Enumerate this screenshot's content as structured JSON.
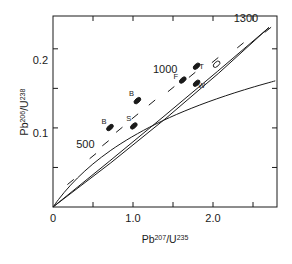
{
  "chart_data": {
    "type": "scatter",
    "title": "",
    "subtitle": "",
    "xlabel": "Pb207/U235",
    "ylabel": "Pb206/U238",
    "xlabel_parts": {
      "base1": "Pb",
      "sup1": "207",
      "slash": "/",
      "base2": "U",
      "sup2": "235"
    },
    "ylabel_parts": {
      "base1": "Pb",
      "sup1": "206",
      "slash": "/",
      "base2": "U",
      "sup2": "238"
    },
    "xlim": [
      0.0,
      2.8
    ],
    "ylim": [
      0.0,
      0.2415
    ],
    "grid": false,
    "legend": "none",
    "xticks": [
      0.0,
      0.5,
      1.0,
      1.5,
      2.0,
      2.5
    ],
    "xticklabels": [
      "0",
      "",
      "1.0",
      "",
      "2.0",
      ""
    ],
    "yticks": [
      0.0,
      0.05,
      0.1,
      0.15,
      0.2
    ],
    "yticklabels": [
      "",
      "",
      "0.1",
      "",
      "0.2"
    ],
    "curves": [
      {
        "name": "concordia",
        "style": "solid-with-age-ticks",
        "points": [
          [
            0.0,
            0.0
          ],
          [
            0.0676,
            0.00932
          ],
          [
            0.1408,
            0.01853
          ],
          [
            0.22,
            0.02765
          ],
          [
            0.3057,
            0.03665
          ],
          [
            0.3982,
            0.04556
          ],
          [
            0.4982,
            0.05436
          ],
          [
            0.6062,
            0.06306
          ],
          [
            0.7228,
            0.07166
          ],
          [
            0.8486,
            0.08015
          ],
          [
            0.9841,
            0.08854
          ],
          [
            1.1302,
            0.09683
          ],
          [
            1.2875,
            0.10501
          ],
          [
            1.4569,
            0.11309
          ],
          [
            1.6391,
            0.12108
          ],
          [
            1.8352,
            0.12896
          ],
          [
            2.0461,
            0.13674
          ],
          [
            2.2728,
            0.14442
          ],
          [
            2.5165,
            0.15201
          ],
          [
            2.7783,
            0.1595
          ]
        ],
        "age_ticks": [
          {
            "age": 200,
            "x": 0.22,
            "y": 0.03165
          },
          {
            "age": 400,
            "x": 0.4982,
            "y": 0.06436
          },
          {
            "age": 500,
            "x": 0.6562,
            "y": 0.08056
          },
          {
            "age": 600,
            "x": 0.8286,
            "y": 0.09766
          },
          {
            "age": 700,
            "x": 1.0241,
            "y": 0.11454
          },
          {
            "age": 800,
            "x": 1.2375,
            "y": 0.13201
          },
          {
            "age": 900,
            "x": 1.4769,
            "y": 0.14909
          },
          {
            "age": 1000,
            "x": 1.7391,
            "y": 0.16708
          },
          {
            "age": 1100,
            "x": 2.0261,
            "y": 0.18574
          },
          {
            "age": 1200,
            "x": 2.3428,
            "y": 0.20442
          },
          {
            "age": 1300,
            "x": 2.6865,
            "y": 0.22401
          }
        ]
      },
      {
        "name": "discordia-upper",
        "style": "solid",
        "points": [
          [
            0.0,
            0.0
          ],
          [
            2.7,
            0.227
          ]
        ]
      },
      {
        "name": "discordia-lower",
        "style": "solid",
        "points": [
          [
            0.0,
            0.0
          ],
          [
            2.7,
            0.227
          ]
        ]
      }
    ],
    "age_labels": [
      {
        "text": "500",
        "x": 0.52,
        "y": 0.0745,
        "anchor": "end"
      },
      {
        "text": "1000",
        "x": 1.555,
        "y": 0.17,
        "anchor": "end"
      },
      {
        "text": "1300",
        "x": 2.565,
        "y": 0.2335,
        "anchor": "end"
      }
    ],
    "points": [
      {
        "label": "B",
        "x": 0.712,
        "y": 0.1005,
        "fill": "solid",
        "label_dx": -6,
        "label_dy": -4
      },
      {
        "label": "B",
        "x": 1.055,
        "y": 0.1345,
        "fill": "solid",
        "label_dx": -6,
        "label_dy": -5
      },
      {
        "label": "S",
        "x": 1.01,
        "y": 0.1025,
        "fill": "solid",
        "label_dx": -5,
        "label_dy": -5
      },
      {
        "label": "F",
        "x": 1.622,
        "y": 0.1605,
        "fill": "solid",
        "label_dx": -7,
        "label_dy": -1
      },
      {
        "label": "T",
        "x": 1.795,
        "y": 0.178,
        "fill": "solid",
        "label_dx": 5,
        "label_dy": 3
      },
      {
        "label": "W",
        "x": 1.795,
        "y": 0.1565,
        "fill": "solid",
        "label_dx": 5,
        "label_dy": 5
      },
      {
        "label": "",
        "x": 2.045,
        "y": 0.1805,
        "fill": "open",
        "label_dx": 0,
        "label_dy": 0
      }
    ]
  },
  "axes": {
    "x_tick_label_0": "0",
    "x_tick_label_1": "1.0",
    "x_tick_label_2": "2.0",
    "y_tick_label_1": "0.1",
    "y_tick_label_2": "0.2",
    "x_base_1": "Pb",
    "x_sup_1": "207",
    "x_sep": "/",
    "x_base_2": "U",
    "x_sup_2": "235",
    "y_base_1": "Pb",
    "y_sup_1": "206",
    "y_sep": "/",
    "y_base_2": "U",
    "y_sup_2": "238"
  },
  "annotations": {
    "age_500": "500",
    "age_1000": "1000",
    "age_1300": "1300",
    "point_b1": "B",
    "point_b2": "B",
    "point_s": "S",
    "point_f": "F",
    "point_t": "T",
    "point_w": "W"
  },
  "colors": {
    "ink": "#1a1a1a",
    "curve": "#2b2b2b",
    "background": "#ffffff"
  }
}
